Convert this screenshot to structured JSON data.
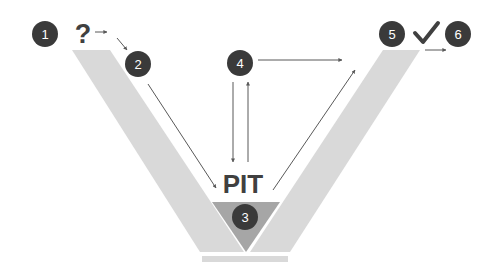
{
  "diagram": {
    "colors": {
      "band": "#d9d9d9",
      "pit": "#a6a6a6",
      "base": "#d9d9d9",
      "circle": "#3a3a3a",
      "circle_text": "#ffffff",
      "arrow": "#595959",
      "label": "#404040"
    },
    "steps": [
      {
        "id": 1,
        "label": "1"
      },
      {
        "id": 2,
        "label": "2"
      },
      {
        "id": 3,
        "label": "3"
      },
      {
        "id": 4,
        "label": "4"
      },
      {
        "id": 5,
        "label": "5"
      },
      {
        "id": 6,
        "label": "6"
      }
    ],
    "question_mark": "?",
    "check_mark": "✓",
    "pit_label": "PIT"
  }
}
